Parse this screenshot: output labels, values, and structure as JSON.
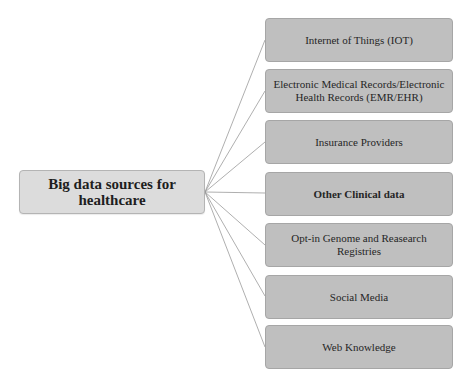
{
  "diagram": {
    "root": {
      "label": "Big data sources for healthcare"
    },
    "sources": [
      {
        "label": "Internet of Things (IOT)",
        "top": 18,
        "bold": false
      },
      {
        "label": "Electronic Medical Records/Electronic Health Records (EMR/EHR)",
        "top": 69,
        "bold": false
      },
      {
        "label": "Insurance Providers",
        "top": 120,
        "bold": false
      },
      {
        "label": "Other Clinical data",
        "top": 172,
        "bold": true
      },
      {
        "label": "Opt-in Genome and Reasearch Registries",
        "top": 223,
        "bold": false
      },
      {
        "label": "Social Media",
        "top": 275,
        "bold": false
      },
      {
        "label": "Web Knowledge",
        "top": 325,
        "bold": false
      }
    ],
    "colors": {
      "root_fill": "#dcdcdc",
      "leaf_fill": "#bfbfbf",
      "leaf_border": "#a6a6a6",
      "connector": "#9a9a9a"
    }
  }
}
